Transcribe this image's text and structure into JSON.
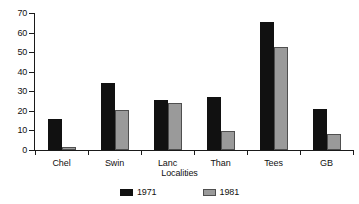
{
  "chart_data": {
    "type": "bar",
    "title": "",
    "subtitle": "",
    "xlabel": "Localities",
    "ylabel": "",
    "categories": [
      "Chel",
      "Swin",
      "Lanc",
      "Than",
      "Tees",
      "GB"
    ],
    "series": [
      {
        "name": "1971",
        "color": "#111111",
        "values": [
          16,
          34,
          25.5,
          27,
          65.5,
          21
        ]
      },
      {
        "name": "1981",
        "color": "#9a9a9a",
        "values": [
          1.5,
          20.5,
          24,
          9.5,
          52.5,
          8
        ]
      }
    ],
    "ylim": [
      0,
      70
    ],
    "ytick_values": [
      0,
      10,
      20,
      30,
      40,
      50,
      60,
      70
    ],
    "ytick_labels": [
      "0",
      "10",
      "20",
      "30",
      "40",
      "50",
      "60",
      "70"
    ],
    "grid": false,
    "legend_position": "bottom-center",
    "legend_entries": [
      "1971",
      "1981"
    ]
  }
}
